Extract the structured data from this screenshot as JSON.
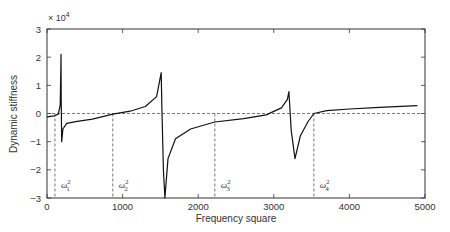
{
  "chart_data": {
    "type": "line",
    "title": "",
    "xlabel": "Frequency square",
    "ylabel": "Dynamic stiffness",
    "y_multiplier": "× 10",
    "y_multiplier_exp": "4",
    "xlim": [
      0,
      5000
    ],
    "ylim": [
      -3,
      3
    ],
    "xticks": [
      0,
      1000,
      2000,
      3000,
      4000,
      5000
    ],
    "xtick_labels": [
      "0",
      "1000",
      "2000",
      "3000",
      "4000",
      "5000"
    ],
    "yticks": [
      3,
      2,
      1,
      0,
      -1,
      -2,
      -3
    ],
    "ytick_labels": [
      "3",
      "2",
      "1",
      "0",
      "−1",
      "−2",
      "−3"
    ],
    "grid": false,
    "legend": null,
    "zero_line": {
      "style": "dashed",
      "y": 0
    },
    "natural_frequencies": [
      {
        "label": "ω",
        "sub": "1",
        "sup": "2",
        "x": 105
      },
      {
        "label": "ω",
        "sub": "2",
        "sup": "2",
        "x": 870
      },
      {
        "label": "ω",
        "sub": "3",
        "sup": "2",
        "x": 2220
      },
      {
        "label": "ω",
        "sub": "4",
        "sup": "2",
        "x": 3530
      }
    ],
    "series": [
      {
        "name": "Dynamic stiffness",
        "x": [
          0,
          100,
          150,
          175,
          182,
          185,
          188,
          195,
          210,
          260,
          400,
          600,
          870,
          1100,
          1300,
          1450,
          1510,
          1520,
          1540,
          1560,
          1600,
          1700,
          1900,
          2220,
          2600,
          2900,
          3100,
          3180,
          3200,
          3230,
          3280,
          3350,
          3450,
          3530,
          3700,
          4000,
          4400,
          4900
        ],
        "y": [
          -0.12,
          -0.08,
          -0.02,
          0.3,
          1.5,
          2.1,
          0.5,
          -1.0,
          -0.55,
          -0.35,
          -0.28,
          -0.2,
          -0.02,
          0.08,
          0.25,
          0.6,
          1.45,
          0.2,
          -2.0,
          -3.0,
          -1.6,
          -0.9,
          -0.55,
          -0.3,
          -0.18,
          -0.05,
          0.2,
          0.5,
          0.78,
          -0.6,
          -1.6,
          -0.8,
          -0.3,
          0.0,
          0.1,
          0.16,
          0.22,
          0.28
        ]
      }
    ]
  }
}
